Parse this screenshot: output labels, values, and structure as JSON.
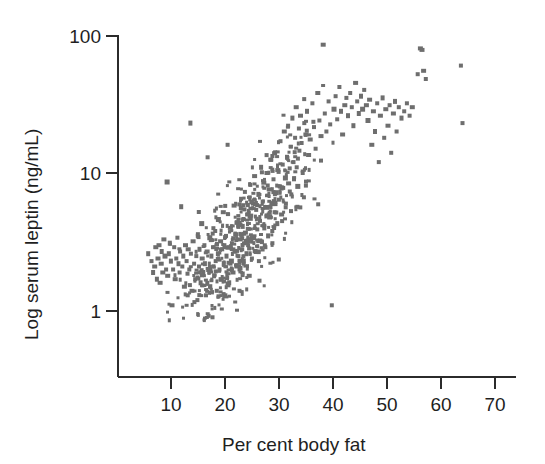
{
  "chart_data": {
    "type": "scatter",
    "title": "",
    "xlabel": "Per cent body fat",
    "ylabel": "Log serum leptin (ng/mL)",
    "yscale": "log",
    "xscale": "linear",
    "xlim": [
      4,
      72
    ],
    "ylim": [
      0.8,
      110
    ],
    "xticks": [
      10,
      20,
      30,
      40,
      50,
      60,
      70
    ],
    "xticklabels": [
      "10",
      "20",
      "30",
      "40",
      "50",
      "60",
      "70"
    ],
    "yticks": [
      1,
      10,
      100
    ],
    "yticklabels": [
      "1",
      "10",
      "100"
    ],
    "grid": false,
    "legend": null,
    "marker": {
      "shape": "square",
      "size_px": 4,
      "color": "#6e6e6e"
    },
    "n_points": 460,
    "points": [
      [
        5.6,
        2.6
      ],
      [
        6.2,
        2.3
      ],
      [
        6.5,
        1.9
      ],
      [
        6.8,
        2.1
      ],
      [
        7.0,
        2.9
      ],
      [
        7.2,
        1.7
      ],
      [
        7.4,
        2.4
      ],
      [
        7.6,
        3.0
      ],
      [
        7.8,
        1.6
      ],
      [
        8.0,
        2.2
      ],
      [
        8.1,
        2.7
      ],
      [
        8.3,
        1.9
      ],
      [
        8.5,
        3.3
      ],
      [
        8.7,
        2.5
      ],
      [
        8.9,
        2.0
      ],
      [
        9.1,
        8.6
      ],
      [
        9.2,
        1.8
      ],
      [
        9.4,
        2.6
      ],
      [
        9.6,
        3.1
      ],
      [
        9.8,
        2.3
      ],
      [
        10.0,
        1.1
      ],
      [
        10.2,
        2.0
      ],
      [
        10.4,
        2.9
      ],
      [
        10.6,
        1.7
      ],
      [
        10.8,
        2.4
      ],
      [
        11.0,
        3.4
      ],
      [
        11.2,
        2.2
      ],
      [
        11.4,
        1.9
      ],
      [
        11.5,
        2.7
      ],
      [
        11.7,
        5.7
      ],
      [
        11.9,
        2.1
      ],
      [
        12.1,
        2.5
      ],
      [
        12.3,
        1.5
      ],
      [
        12.5,
        3.0
      ],
      [
        12.7,
        2.3
      ],
      [
        12.9,
        1.3
      ],
      [
        13.0,
        2.8
      ],
      [
        13.2,
        2.0
      ],
      [
        13.4,
        23.0
      ],
      [
        13.5,
        2.6
      ],
      [
        13.7,
        1.4
      ],
      [
        13.9,
        3.2
      ],
      [
        14.1,
        2.2
      ],
      [
        14.3,
        1.7
      ],
      [
        14.5,
        2.5
      ],
      [
        14.7,
        1.2
      ],
      [
        14.8,
        3.6
      ],
      [
        15.0,
        2.1
      ],
      [
        15.1,
        2.8
      ],
      [
        15.3,
        1.6
      ],
      [
        15.5,
        4.3
      ],
      [
        15.6,
        2.4
      ],
      [
        15.8,
        1.9
      ],
      [
        16.0,
        3.0
      ],
      [
        16.1,
        2.2
      ],
      [
        16.3,
        1.3
      ],
      [
        16.5,
        2.7
      ],
      [
        16.6,
        13.0
      ],
      [
        16.8,
        2.0
      ],
      [
        17.0,
        3.4
      ],
      [
        17.1,
        1.5
      ],
      [
        17.3,
        2.5
      ],
      [
        17.5,
        0.9
      ],
      [
        17.6,
        2.9
      ],
      [
        17.8,
        1.8
      ],
      [
        18.0,
        3.8
      ],
      [
        18.1,
        2.3
      ],
      [
        18.3,
        1.4
      ],
      [
        18.5,
        2.6
      ],
      [
        18.6,
        4.6
      ],
      [
        18.8,
        2.0
      ],
      [
        19.0,
        3.2
      ],
      [
        19.1,
        1.7
      ],
      [
        19.3,
        2.8
      ],
      [
        19.5,
        5.2
      ],
      [
        19.6,
        2.2
      ],
      [
        19.8,
        1.3
      ],
      [
        20.0,
        3.5
      ],
      [
        20.1,
        2.5
      ],
      [
        20.3,
        16.0
      ],
      [
        20.5,
        2.9
      ],
      [
        20.6,
        1.6
      ],
      [
        20.8,
        4.0
      ],
      [
        21.0,
        2.3
      ],
      [
        21.1,
        3.1
      ],
      [
        21.3,
        1.9
      ],
      [
        21.5,
        5.8
      ],
      [
        21.6,
        2.7
      ],
      [
        21.8,
        3.6
      ],
      [
        22.0,
        2.1
      ],
      [
        22.1,
        4.4
      ],
      [
        22.3,
        2.5
      ],
      [
        22.5,
        1.4
      ],
      [
        22.6,
        3.3
      ],
      [
        22.8,
        6.5
      ],
      [
        23.0,
        2.8
      ],
      [
        23.1,
        4.1
      ],
      [
        23.3,
        2.2
      ],
      [
        23.5,
        7.3
      ],
      [
        23.6,
        3.7
      ],
      [
        23.8,
        2.6
      ],
      [
        24.0,
        5.0
      ],
      [
        24.1,
        3.0
      ],
      [
        24.3,
        1.8
      ],
      [
        24.5,
        8.2
      ],
      [
        24.6,
        4.7
      ],
      [
        24.8,
        2.4
      ],
      [
        25.0,
        6.0
      ],
      [
        25.1,
        3.4
      ],
      [
        25.3,
        9.5
      ],
      [
        25.5,
        2.7
      ],
      [
        25.6,
        5.4
      ],
      [
        25.8,
        3.9
      ],
      [
        26.0,
        7.0
      ],
      [
        26.1,
        2.3
      ],
      [
        26.3,
        4.5
      ],
      [
        26.5,
        11.0
      ],
      [
        26.6,
        3.2
      ],
      [
        26.8,
        6.2
      ],
      [
        27.0,
        8.5
      ],
      [
        27.1,
        4.0
      ],
      [
        27.3,
        2.9
      ],
      [
        27.5,
        5.6
      ],
      [
        27.6,
        10.0
      ],
      [
        27.8,
        3.5
      ],
      [
        28.0,
        7.6
      ],
      [
        28.1,
        4.8
      ],
      [
        28.3,
        12.5
      ],
      [
        28.5,
        6.0
      ],
      [
        28.6,
        3.1
      ],
      [
        28.8,
        9.0
      ],
      [
        29.0,
        5.2
      ],
      [
        29.1,
        14.0
      ],
      [
        29.3,
        7.2
      ],
      [
        29.5,
        4.3
      ],
      [
        29.6,
        10.5
      ],
      [
        29.8,
        6.4
      ],
      [
        30.0,
        8.0
      ],
      [
        30.1,
        17.0
      ],
      [
        30.3,
        5.0
      ],
      [
        30.5,
        11.5
      ],
      [
        30.6,
        7.8
      ],
      [
        30.8,
        20.0
      ],
      [
        31.0,
        9.2
      ],
      [
        31.1,
        6.0
      ],
      [
        31.3,
        13.0
      ],
      [
        31.5,
        22.0
      ],
      [
        31.6,
        8.4
      ],
      [
        31.8,
        10.8
      ],
      [
        32.0,
        15.5
      ],
      [
        32.1,
        7.0
      ],
      [
        32.3,
        25.0
      ],
      [
        32.5,
        12.0
      ],
      [
        32.6,
        9.0
      ],
      [
        32.8,
        18.0
      ],
      [
        33.0,
        30.0
      ],
      [
        33.1,
        11.0
      ],
      [
        33.3,
        8.0
      ],
      [
        33.5,
        21.0
      ],
      [
        33.6,
        14.5
      ],
      [
        33.8,
        26.0
      ],
      [
        34.0,
        16.5
      ],
      [
        34.2,
        10.0
      ],
      [
        34.5,
        23.0
      ],
      [
        34.8,
        19.0
      ],
      [
        35.0,
        28.0
      ],
      [
        35.3,
        13.5
      ],
      [
        35.6,
        17.5
      ],
      [
        36.0,
        32.0
      ],
      [
        36.3,
        21.5
      ],
      [
        36.6,
        15.0
      ],
      [
        37.0,
        38.0
      ],
      [
        37.3,
        24.0
      ],
      [
        37.6,
        18.5
      ],
      [
        38.0,
        85.0
      ],
      [
        38.3,
        27.0
      ],
      [
        38.6,
        20.0
      ],
      [
        39.0,
        33.0
      ],
      [
        39.3,
        22.5
      ],
      [
        39.6,
        1.1
      ],
      [
        40.0,
        29.0
      ],
      [
        40.3,
        36.0
      ],
      [
        40.6,
        24.5
      ],
      [
        41.0,
        42.0
      ],
      [
        41.3,
        28.0
      ],
      [
        41.6,
        19.0
      ],
      [
        42.0,
        31.0
      ],
      [
        42.3,
        35.0
      ],
      [
        42.6,
        26.0
      ],
      [
        43.0,
        38.0
      ],
      [
        43.3,
        30.0
      ],
      [
        43.6,
        22.0
      ],
      [
        44.0,
        45.0
      ],
      [
        44.3,
        33.0
      ],
      [
        44.6,
        27.0
      ],
      [
        45.0,
        36.0
      ],
      [
        45.3,
        29.0
      ],
      [
        45.6,
        40.0
      ],
      [
        46.0,
        31.0
      ],
      [
        46.3,
        24.0
      ],
      [
        46.6,
        34.0
      ],
      [
        47.0,
        16.0
      ],
      [
        47.3,
        28.0
      ],
      [
        47.6,
        20.0
      ],
      [
        48.0,
        32.0
      ],
      [
        48.3,
        12.0
      ],
      [
        48.6,
        26.0
      ],
      [
        49.0,
        35.0
      ],
      [
        49.3,
        18.0
      ],
      [
        49.6,
        29.0
      ],
      [
        50.0,
        22.0
      ],
      [
        50.3,
        31.0
      ],
      [
        50.6,
        14.0
      ],
      [
        51.0,
        27.0
      ],
      [
        51.3,
        33.0
      ],
      [
        51.6,
        20.0
      ],
      [
        52.0,
        30.0
      ],
      [
        52.5,
        25.0
      ],
      [
        53.0,
        28.0
      ],
      [
        53.5,
        32.0
      ],
      [
        54.0,
        26.0
      ],
      [
        54.5,
        30.0
      ],
      [
        55.5,
        52.0
      ],
      [
        56.0,
        80.0
      ],
      [
        56.3,
        78.0
      ],
      [
        56.6,
        55.0
      ],
      [
        57.0,
        48.0
      ],
      [
        63.5,
        60.0
      ],
      [
        63.8,
        23.0
      ]
    ]
  },
  "axes": {
    "y_tick_100": "100",
    "y_tick_10": "10",
    "y_tick_1": "1",
    "x_tick_10": "10",
    "x_tick_20": "20",
    "x_tick_30": "30",
    "x_tick_40": "40",
    "x_tick_50": "50",
    "x_tick_60": "60",
    "x_tick_70": "70",
    "x_title": "Per cent body fat",
    "y_title": "Log serum leptin (ng/mL)"
  },
  "colors": {
    "marker": "#6e6e6e",
    "axis": "#2b2b2b",
    "text": "#1f1f1f",
    "background": "#ffffff"
  }
}
